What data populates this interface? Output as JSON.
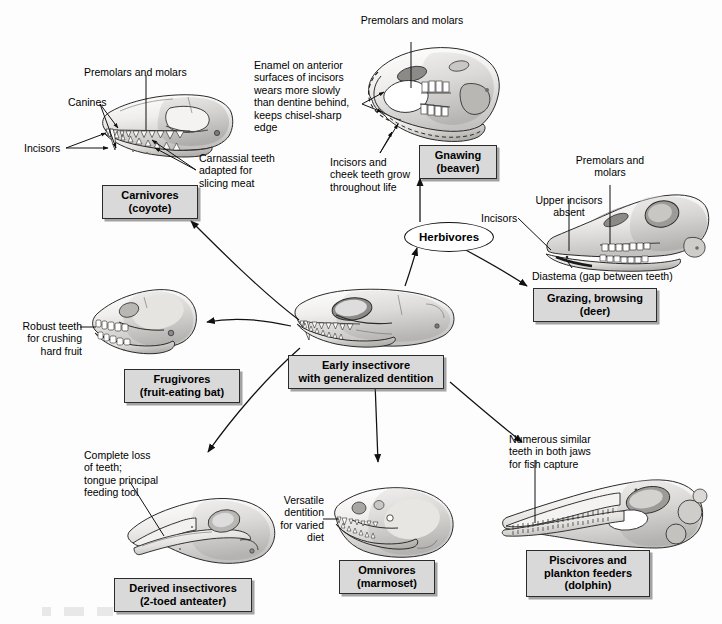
{
  "figure": {
    "background_color": "#fdfdfd",
    "box_fill_color": "#d9d9d9",
    "box_border_color": "#2b2b2b"
  },
  "center": {
    "box_label": "Early insectivore\nwith generalized dentition"
  },
  "hub": {
    "herbivores_label": "Herbivores"
  },
  "boxes": {
    "carnivores": "Carnivores\n(coyote)",
    "gnawing": "Gnawing\n(beaver)",
    "grazing": "Grazing, browsing\n(deer)",
    "frugivores": "Frugivores\n(fruit-eating bat)",
    "derived_insectivores": "Derived insectivores\n(2-toed anteater)",
    "omnivores": "Omnivores\n(marmoset)",
    "piscivores": "Piscivores and\nplankton feeders\n(dolphin)"
  },
  "annotations": {
    "coyote_premolars": "Premolars and molars",
    "coyote_canines": "Canines",
    "coyote_incisors": "Incisors",
    "coyote_carnassial": "Carnassial teeth\nadapted for\nslicing meat",
    "beaver_premolars": "Premolars and molars",
    "beaver_enamel": "Enamel on anterior\nsurfaces of incisors\nwears more slowly\nthan dentine behind,\nkeeps chisel-sharp\nedge",
    "beaver_growth": "Incisors and\ncheek teeth grow\nthroughout life",
    "deer_premolars": "Premolars and\nmolars",
    "deer_upper_incisors": "Upper incisors\nabsent",
    "deer_incisors": "Incisors",
    "deer_diastema": "Diastema (gap between teeth)",
    "bat_teeth": "Robust teeth\nfor crushing\nhard fruit",
    "anteater_teeth": "Complete loss\nof teeth;\ntongue principal\nfeeding tool",
    "marmoset_dentition": "Versatile\ndentition\nfor varied\ndiet",
    "dolphin_teeth": "Numerous similar\nteeth in both jaws\nfor fish capture"
  }
}
